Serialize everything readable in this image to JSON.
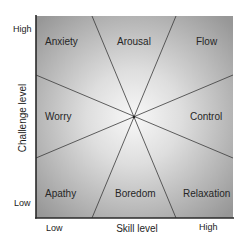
{
  "diagram": {
    "x_axis": {
      "label": "Skill level",
      "ticks": [
        "Low",
        "High"
      ]
    },
    "y_axis": {
      "label": "Challenge level",
      "ticks": [
        "High",
        "Low"
      ]
    },
    "regions": [
      {
        "id": "anxiety",
        "label": "Anxiety"
      },
      {
        "id": "arousal",
        "label": "Arousal"
      },
      {
        "id": "flow",
        "label": "Flow"
      },
      {
        "id": "worry",
        "label": "Worry"
      },
      {
        "id": "control",
        "label": "Control"
      },
      {
        "id": "apathy",
        "label": "Apathy"
      },
      {
        "id": "boredom",
        "label": "Boredom"
      },
      {
        "id": "relaxation",
        "label": "Relaxation"
      }
    ],
    "colors": {
      "center": "#f6f6f6",
      "edge": "#9c9c9c",
      "line": "#3a3a3a",
      "axis": "#2a2a2a"
    }
  }
}
